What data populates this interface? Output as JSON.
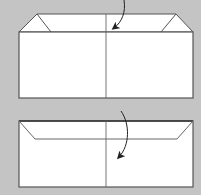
{
  "diagram": {
    "type": "origami-fold-steps",
    "background_color": "#c4c4c4",
    "paper_color": "#ffffff",
    "line_color": "#555555",
    "steps": [
      {
        "name": "step-1",
        "description": "Paper rectangle with top edge folded down; corner flaps visible at top-left and top-right; vertical center crease",
        "arrow": "curved arrow from above pointing down-left into center"
      },
      {
        "name": "step-2",
        "description": "Rectangle with folded band along top edge, angled corners; vertical center crease",
        "arrow": "curved arrow pointing down-left over center crease"
      }
    ]
  }
}
